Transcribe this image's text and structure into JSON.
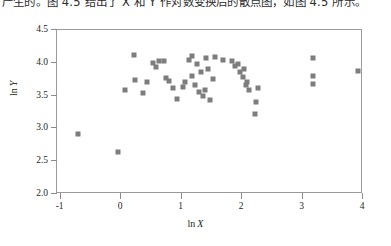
{
  "caption": {
    "text": "产生的。图 4.5 给出了 X 和 Y 作对数变换后的散点图，如图 4.5 所示。"
  },
  "chart_data": {
    "type": "scatter",
    "title": "",
    "xlabel": "ln X",
    "ylabel": "ln Y",
    "xlim": [
      -1.06,
      4.0
    ],
    "ylim": [
      2.0,
      4.5
    ],
    "xticks": [
      -1,
      0,
      1,
      2,
      3,
      4
    ],
    "xticklabels": [
      "-1",
      "0",
      "1",
      "2",
      "3",
      "4"
    ],
    "yticks": [
      2.0,
      2.5,
      3.0,
      3.5,
      4.0,
      4.5
    ],
    "yticklabels": [
      "2.0",
      "2.5",
      "3.0",
      "3.5",
      "4.0",
      "4.5"
    ],
    "grid": false,
    "legend": null,
    "marker": "square",
    "marker_color": "#7d7d7d",
    "marker_size": 5,
    "points": [
      {
        "x": -0.72,
        "y": 2.92
      },
      {
        "x": -0.05,
        "y": 2.64
      },
      {
        "x": 0.07,
        "y": 3.58
      },
      {
        "x": 0.22,
        "y": 4.12
      },
      {
        "x": 0.23,
        "y": 3.74
      },
      {
        "x": 0.36,
        "y": 3.54
      },
      {
        "x": 0.43,
        "y": 3.71
      },
      {
        "x": 0.53,
        "y": 4.0
      },
      {
        "x": 0.57,
        "y": 3.93
      },
      {
        "x": 0.62,
        "y": 4.02
      },
      {
        "x": 0.71,
        "y": 4.03
      },
      {
        "x": 0.74,
        "y": 3.77
      },
      {
        "x": 0.79,
        "y": 3.73
      },
      {
        "x": 0.86,
        "y": 3.61
      },
      {
        "x": 0.93,
        "y": 3.45
      },
      {
        "x": 1.02,
        "y": 3.63
      },
      {
        "x": 1.05,
        "y": 3.71
      },
      {
        "x": 1.13,
        "y": 4.05
      },
      {
        "x": 1.17,
        "y": 4.11
      },
      {
        "x": 1.18,
        "y": 3.8
      },
      {
        "x": 1.22,
        "y": 3.66
      },
      {
        "x": 1.26,
        "y": 3.98
      },
      {
        "x": 1.28,
        "y": 3.55
      },
      {
        "x": 1.32,
        "y": 3.86
      },
      {
        "x": 1.36,
        "y": 3.49
      },
      {
        "x": 1.38,
        "y": 3.59
      },
      {
        "x": 1.41,
        "y": 4.07
      },
      {
        "x": 1.44,
        "y": 3.91
      },
      {
        "x": 1.47,
        "y": 3.44
      },
      {
        "x": 1.52,
        "y": 3.76
      },
      {
        "x": 1.56,
        "y": 4.09
      },
      {
        "x": 1.68,
        "y": 4.04
      },
      {
        "x": 1.83,
        "y": 4.02
      },
      {
        "x": 1.88,
        "y": 3.95
      },
      {
        "x": 1.93,
        "y": 3.98
      },
      {
        "x": 1.97,
        "y": 3.86
      },
      {
        "x": 2.01,
        "y": 3.78
      },
      {
        "x": 2.03,
        "y": 3.9
      },
      {
        "x": 2.06,
        "y": 3.66
      },
      {
        "x": 2.09,
        "y": 3.71
      },
      {
        "x": 2.12,
        "y": 3.58
      },
      {
        "x": 2.27,
        "y": 3.62
      },
      {
        "x": 2.23,
        "y": 3.4
      },
      {
        "x": 2.22,
        "y": 3.22
      },
      {
        "x": 3.18,
        "y": 4.08
      },
      {
        "x": 3.18,
        "y": 3.8
      },
      {
        "x": 3.18,
        "y": 3.68
      },
      {
        "x": 3.92,
        "y": 3.88
      }
    ]
  }
}
